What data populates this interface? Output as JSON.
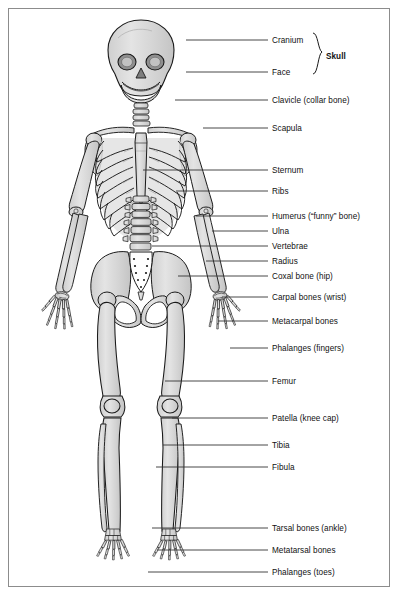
{
  "diagram": {
    "frame_color": "#8c8c8c",
    "background": "#ffffff",
    "bone_fill": "#d9d9d9",
    "bone_fill_light": "#e6e6e6",
    "bone_outline": "#1a1a1a",
    "leader_color": "#333333",
    "text_color": "#111111"
  },
  "labels": [
    {
      "id": "cranium",
      "text": "Cranium",
      "x": 272,
      "y": 36,
      "line_x1": 186,
      "line_y1": 40,
      "line_x2": 268,
      "line_y2": 40
    },
    {
      "id": "face",
      "text": "Face",
      "x": 272,
      "y": 68,
      "line_x1": 186,
      "line_y1": 72,
      "line_x2": 268,
      "line_y2": 72
    },
    {
      "id": "skull",
      "text": "Skull",
      "x": 326,
      "y": 52
    },
    {
      "id": "clavicle",
      "text": "Clavicle (collar bone)",
      "x": 272,
      "y": 96,
      "line_x1": 175,
      "line_y1": 100,
      "line_x2": 268,
      "line_y2": 100
    },
    {
      "id": "scapula",
      "text": "Scapula",
      "x": 272,
      "y": 124,
      "line_x1": 203,
      "line_y1": 128,
      "line_x2": 268,
      "line_y2": 128
    },
    {
      "id": "sternum",
      "text": "Sternum",
      "x": 272,
      "y": 166,
      "line_x1": 143,
      "line_y1": 170,
      "line_x2": 268,
      "line_y2": 170
    },
    {
      "id": "ribs",
      "text": "Ribs",
      "x": 272,
      "y": 187,
      "line_x1": 176,
      "line_y1": 191,
      "line_x2": 268,
      "line_y2": 191
    },
    {
      "id": "humerus",
      "text": "Humerus (“funny” bone)",
      "x": 272,
      "y": 212,
      "line_x1": 196,
      "line_y1": 216,
      "line_x2": 268,
      "line_y2": 216
    },
    {
      "id": "ulna",
      "text": "Ulna",
      "x": 272,
      "y": 227,
      "line_x1": 212,
      "line_y1": 231,
      "line_x2": 268,
      "line_y2": 231
    },
    {
      "id": "vertebrae",
      "text": "Vertebrae",
      "x": 272,
      "y": 242,
      "line_x1": 152,
      "line_y1": 246,
      "line_x2": 268,
      "line_y2": 246
    },
    {
      "id": "radius",
      "text": "Radius",
      "x": 272,
      "y": 257,
      "line_x1": 206,
      "line_y1": 261,
      "line_x2": 268,
      "line_y2": 261
    },
    {
      "id": "coxal",
      "text": "Coxal bone (hip)",
      "x": 272,
      "y": 272,
      "line_x1": 178,
      "line_y1": 276,
      "line_x2": 268,
      "line_y2": 276
    },
    {
      "id": "carpal",
      "text": "Carpal bones (wrist)",
      "x": 272,
      "y": 293,
      "line_x1": 222,
      "line_y1": 297,
      "line_x2": 268,
      "line_y2": 297
    },
    {
      "id": "metacarpal",
      "text": "Metacarpal bones",
      "x": 272,
      "y": 317,
      "line_x1": 218,
      "line_y1": 321,
      "line_x2": 268,
      "line_y2": 321
    },
    {
      "id": "phalanges_fingers",
      "text": "Phalanges (fingers)",
      "x": 272,
      "y": 344,
      "line_x1": 230,
      "line_y1": 348,
      "line_x2": 268,
      "line_y2": 348
    },
    {
      "id": "femur",
      "text": "Femur",
      "x": 272,
      "y": 377,
      "line_x1": 165,
      "line_y1": 381,
      "line_x2": 268,
      "line_y2": 381
    },
    {
      "id": "patella",
      "text": "Patella (knee cap)",
      "x": 272,
      "y": 414,
      "line_x1": 172,
      "line_y1": 418,
      "line_x2": 268,
      "line_y2": 418
    },
    {
      "id": "tibia",
      "text": "Tibia",
      "x": 272,
      "y": 441,
      "line_x1": 163,
      "line_y1": 445,
      "line_x2": 268,
      "line_y2": 445
    },
    {
      "id": "fibula",
      "text": "Fibula",
      "x": 272,
      "y": 463,
      "line_x1": 156,
      "line_y1": 467,
      "line_x2": 268,
      "line_y2": 467
    },
    {
      "id": "tarsal",
      "text": "Tarsal bones (ankle)",
      "x": 272,
      "y": 524,
      "line_x1": 152,
      "line_y1": 528,
      "line_x2": 268,
      "line_y2": 528
    },
    {
      "id": "metatarsal",
      "text": "Metatarsal bones",
      "x": 272,
      "y": 546,
      "line_x1": 157,
      "line_y1": 550,
      "line_x2": 268,
      "line_y2": 550
    },
    {
      "id": "phalanges_toes",
      "text": "Phalanges (toes)",
      "x": 272,
      "y": 568,
      "line_x1": 148,
      "line_y1": 572,
      "line_x2": 268,
      "line_y2": 572
    }
  ]
}
